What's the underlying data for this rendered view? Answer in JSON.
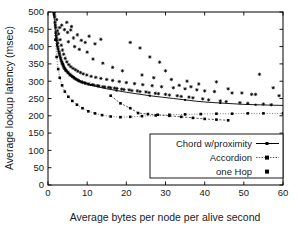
{
  "chart_data": {
    "type": "scatter",
    "title": "",
    "xlabel": "Average bytes per node per alive second",
    "ylabel": "Average lookup latency (msec)",
    "xlim": [
      0,
      60
    ],
    "ylim": [
      0,
      500
    ],
    "xticks": [
      0,
      10,
      20,
      30,
      40,
      50,
      60
    ],
    "yticks": [
      0,
      50,
      100,
      150,
      200,
      250,
      300,
      350,
      400,
      450,
      500
    ],
    "grid": false,
    "legend_position": "lower-right",
    "legend": [
      "Chord w/proximity",
      "Accordion",
      "one Hop"
    ],
    "series": [
      {
        "name": "Chord w/proximity",
        "style": "solid-line-with-small-markers",
        "color": "#000000",
        "convex_hull_curve": [
          [
            1.4,
            500
          ],
          [
            1.7,
            470
          ],
          [
            2.0,
            430
          ],
          [
            2.3,
            405
          ],
          [
            2.7,
            385
          ],
          [
            3.2,
            365
          ],
          [
            3.8,
            350
          ],
          [
            4.5,
            336
          ],
          [
            5.4,
            322
          ],
          [
            6.5,
            312
          ],
          [
            7.8,
            303
          ],
          [
            9.2,
            296
          ],
          [
            11.0,
            289
          ],
          [
            13.0,
            283
          ],
          [
            15.0,
            278
          ],
          [
            17.5,
            273
          ],
          [
            20.0,
            268
          ],
          [
            23.0,
            263
          ],
          [
            26.0,
            258
          ],
          [
            29.0,
            254
          ],
          [
            32.0,
            250
          ],
          [
            35.0,
            246
          ],
          [
            38.0,
            242
          ],
          [
            41.0,
            239
          ],
          [
            44.0,
            237
          ],
          [
            47.0,
            235
          ],
          [
            50.0,
            233
          ],
          [
            53.0,
            232
          ],
          [
            56.0,
            231
          ],
          [
            60.0,
            230
          ]
        ],
        "scatter": [
          [
            1.5,
            498
          ],
          [
            1.6,
            492
          ],
          [
            1.7,
            486
          ],
          [
            1.8,
            470
          ],
          [
            1.9,
            462
          ],
          [
            2.0,
            455
          ],
          [
            2.0,
            440
          ],
          [
            2.1,
            432
          ],
          [
            2.2,
            425
          ],
          [
            2.3,
            418
          ],
          [
            2.4,
            446
          ],
          [
            2.5,
            410
          ],
          [
            2.5,
            400
          ],
          [
            2.6,
            393
          ],
          [
            2.7,
            437
          ],
          [
            2.8,
            386
          ],
          [
            2.9,
            380
          ],
          [
            3.0,
            374
          ],
          [
            3.1,
            420
          ],
          [
            3.2,
            368
          ],
          [
            3.3,
            362
          ],
          [
            3.4,
            404
          ],
          [
            3.5,
            357
          ],
          [
            3.6,
            352
          ],
          [
            3.7,
            390
          ],
          [
            3.8,
            348
          ],
          [
            3.9,
            344
          ],
          [
            4.0,
            378
          ],
          [
            4.1,
            340
          ],
          [
            4.2,
            336
          ],
          [
            4.4,
            366
          ],
          [
            4.5,
            333
          ],
          [
            4.6,
            330
          ],
          [
            4.8,
            356
          ],
          [
            5.0,
            327
          ],
          [
            5.1,
            324
          ],
          [
            5.3,
            348
          ],
          [
            5.5,
            321
          ],
          [
            5.6,
            318
          ],
          [
            5.8,
            342
          ],
          [
            6.0,
            316
          ],
          [
            6.2,
            313
          ],
          [
            6.4,
            337
          ],
          [
            6.6,
            311
          ],
          [
            6.8,
            308
          ],
          [
            7.0,
            333
          ],
          [
            7.2,
            306
          ],
          [
            7.4,
            304
          ],
          [
            7.6,
            329
          ],
          [
            7.8,
            302
          ],
          [
            8.0,
            300
          ],
          [
            8.3,
            325
          ],
          [
            8.5,
            298
          ],
          [
            8.8,
            297
          ],
          [
            9.0,
            321
          ],
          [
            9.3,
            295
          ],
          [
            9.6,
            294
          ],
          [
            9.9,
            318
          ],
          [
            10.2,
            292
          ],
          [
            10.5,
            291
          ],
          [
            11.0,
            314
          ],
          [
            11.4,
            290
          ],
          [
            11.8,
            288
          ],
          [
            12.2,
            311
          ],
          [
            12.6,
            287
          ],
          [
            13.0,
            286
          ],
          [
            13.5,
            308
          ],
          [
            14.0,
            284
          ],
          [
            14.5,
            283
          ],
          [
            15.0,
            305
          ],
          [
            15.5,
            282
          ],
          [
            16.0,
            281
          ],
          [
            16.5,
            302
          ],
          [
            17.0,
            280
          ],
          [
            17.6,
            279
          ],
          [
            18.2,
            299
          ],
          [
            18.8,
            277
          ],
          [
            19.4,
            276
          ],
          [
            20.0,
            296
          ],
          [
            20.7,
            275
          ],
          [
            21.4,
            273
          ],
          [
            22.1,
            293
          ],
          [
            22.8,
            272
          ],
          [
            23.5,
            270
          ],
          [
            24.2,
            290
          ],
          [
            25.0,
            269
          ],
          [
            25.8,
            267
          ],
          [
            26.6,
            287
          ],
          [
            27.4,
            265
          ],
          [
            28.2,
            264
          ],
          [
            29.0,
            284
          ],
          [
            30.0,
            262
          ],
          [
            31.0,
            260
          ],
          [
            32.0,
            281
          ],
          [
            33.0,
            258
          ],
          [
            34.0,
            256
          ],
          [
            35.0,
            278
          ],
          [
            36.0,
            254
          ],
          [
            37.0,
            252
          ],
          [
            38.0,
            275
          ],
          [
            39.5,
            249
          ],
          [
            41.0,
            246
          ],
          [
            42.5,
            270
          ],
          [
            44.0,
            243
          ],
          [
            45.5,
            241
          ],
          [
            47.0,
            266
          ],
          [
            49.0,
            238
          ],
          [
            51.0,
            236
          ],
          [
            53.0,
            262
          ],
          [
            55.0,
            234
          ],
          [
            57.0,
            232
          ],
          [
            59.0,
            258
          ],
          [
            3.0,
            455
          ],
          [
            3.5,
            462
          ],
          [
            4.2,
            449
          ],
          [
            5.0,
            441
          ],
          [
            5.8,
            448
          ],
          [
            6.5,
            425
          ],
          [
            7.5,
            434
          ],
          [
            8.5,
            418
          ],
          [
            9.5,
            412
          ],
          [
            10.5,
            430
          ],
          [
            12.0,
            408
          ],
          [
            13.5,
            421
          ],
          [
            4.8,
            470
          ],
          [
            6.0,
            458
          ],
          [
            2.2,
            478
          ],
          [
            21.0,
            412
          ],
          [
            23.5,
            396
          ],
          [
            26.0,
            370
          ],
          [
            28.5,
            355
          ],
          [
            35.5,
            300
          ],
          [
            38.5,
            292
          ],
          [
            43.0,
            298
          ],
          [
            46.0,
            278
          ],
          [
            49.5,
            266
          ],
          [
            52.0,
            262
          ],
          [
            54.0,
            320
          ],
          [
            57.5,
            281
          ],
          [
            19.0,
            330
          ],
          [
            16.5,
            340
          ],
          [
            14.0,
            352
          ],
          [
            11.5,
            364
          ],
          [
            24.0,
            318
          ],
          [
            27.0,
            310
          ],
          [
            31.5,
            305
          ],
          [
            33.5,
            288
          ],
          [
            8.0,
            392
          ],
          [
            10.0,
            384
          ],
          [
            6.8,
            400
          ],
          [
            5.2,
            414
          ],
          [
            30.0,
            330
          ],
          [
            36.5,
            284
          ],
          [
            40.0,
            272
          ]
        ]
      },
      {
        "name": "Accordion",
        "style": "dotted-line-with-square-markers",
        "color": "#444444",
        "points": [
          [
            1.6,
            500
          ],
          [
            1.9,
            420
          ],
          [
            2.2,
            370
          ],
          [
            2.6,
            335
          ],
          [
            3.0,
            310
          ],
          [
            3.6,
            288
          ],
          [
            4.3,
            270
          ],
          [
            5.2,
            255
          ],
          [
            6.2,
            243
          ],
          [
            7.4,
            232
          ],
          [
            8.8,
            222
          ],
          [
            10.3,
            213
          ],
          [
            12.0,
            207
          ],
          [
            13.8,
            202
          ],
          [
            16.0,
            198
          ],
          [
            18.5,
            196
          ],
          [
            21.0,
            197
          ],
          [
            24.0,
            199
          ],
          [
            27.5,
            201
          ],
          [
            31.0,
            203
          ],
          [
            35.0,
            204
          ],
          [
            39.0,
            205
          ],
          [
            43.0,
            206
          ],
          [
            47.0,
            206
          ],
          [
            51.0,
            207
          ],
          [
            55.0,
            207
          ],
          [
            60.0,
            207
          ]
        ]
      },
      {
        "name": "one Hop",
        "style": "dashed-line-with-square-markers",
        "color": "#222222",
        "points": [
          [
            16.0,
            258
          ],
          [
            18.5,
            236
          ],
          [
            21.0,
            222
          ],
          [
            23.0,
            208
          ],
          [
            25.5,
            205
          ],
          [
            28.0,
            203
          ],
          [
            31.0,
            200
          ],
          [
            34.0,
            197
          ],
          [
            37.0,
            194
          ],
          [
            40.0,
            191
          ],
          [
            43.0,
            189
          ],
          [
            46.0,
            187
          ]
        ]
      }
    ]
  },
  "axes": {
    "x_tick_labels": [
      "0",
      "10",
      "20",
      "30",
      "40",
      "50",
      "60"
    ],
    "y_tick_labels": [
      "0",
      "50",
      "100",
      "150",
      "200",
      "250",
      "300",
      "350",
      "400",
      "450",
      "500"
    ],
    "x_title": "Average bytes per node per alive second",
    "y_title": "Average lookup latency (msec)"
  },
  "legend": {
    "entries": [
      {
        "label": "Chord w/proximity",
        "marker": "line-solid-dot"
      },
      {
        "label": "Accordion",
        "marker": "line-dotted-square"
      },
      {
        "label": "one Hop",
        "marker": "square-marker"
      }
    ]
  }
}
